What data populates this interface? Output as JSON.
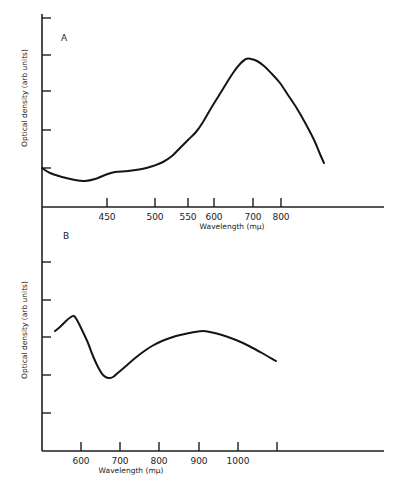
{
  "chart_data": [
    {
      "type": "line",
      "panel_label": "A",
      "title": "",
      "xlabel": "Wavelength (mμ)",
      "ylabel": "Optical density (arb units)",
      "x_scale": "nonlinear (wavenumber-like)",
      "x_ticks": [
        450,
        500,
        550,
        600,
        700,
        800
      ],
      "y_ticks_count": 5,
      "y_tick_labels": [],
      "grid": false,
      "series": [
        {
          "name": "Spectrum A",
          "points": [
            {
              "x": 390,
              "y": 1.0
            },
            {
              "x": 420,
              "y": 0.75
            },
            {
              "x": 450,
              "y": 0.85
            },
            {
              "x": 480,
              "y": 0.95
            },
            {
              "x": 500,
              "y": 1.05
            },
            {
              "x": 530,
              "y": 1.4
            },
            {
              "x": 550,
              "y": 1.7
            },
            {
              "x": 580,
              "y": 2.1
            },
            {
              "x": 600,
              "y": 2.5
            },
            {
              "x": 650,
              "y": 3.3
            },
            {
              "x": 700,
              "y": 3.8
            },
            {
              "x": 750,
              "y": 3.6
            },
            {
              "x": 800,
              "y": 3.1
            },
            {
              "x": 900,
              "y": 2.2
            },
            {
              "x": 1000,
              "y": 1.0
            }
          ]
        }
      ]
    },
    {
      "type": "line",
      "panel_label": "B",
      "title": "",
      "xlabel": "Wavelength (mμ)",
      "ylabel": "Optical density (arb units)",
      "x_scale": "linear",
      "x_ticks": [
        600,
        700,
        800,
        900,
        1000,
        1100
      ],
      "x_tick_labels": [
        "600",
        "700",
        "800",
        "900",
        "1000",
        ""
      ],
      "y_ticks_count": 5,
      "y_tick_labels": [],
      "grid": false,
      "series": [
        {
          "name": "Spectrum B",
          "points": [
            {
              "x": 535,
              "y": 3.15
            },
            {
              "x": 585,
              "y": 3.6
            },
            {
              "x": 615,
              "y": 3.05
            },
            {
              "x": 650,
              "y": 2.1
            },
            {
              "x": 675,
              "y": 1.95
            },
            {
              "x": 700,
              "y": 2.1
            },
            {
              "x": 750,
              "y": 2.45
            },
            {
              "x": 800,
              "y": 2.8
            },
            {
              "x": 850,
              "y": 3.0
            },
            {
              "x": 900,
              "y": 3.1
            },
            {
              "x": 950,
              "y": 3.05
            },
            {
              "x": 1000,
              "y": 2.85
            },
            {
              "x": 1050,
              "y": 2.6
            },
            {
              "x": 1100,
              "y": 2.35
            }
          ]
        }
      ]
    }
  ],
  "panels": {
    "a": {
      "label": "A",
      "xlabel": "Wavelength (mμ)",
      "ylabel": "Optical density (arb units)",
      "ticks": [
        {
          "label": "450",
          "px": 107
        },
        {
          "label": "500",
          "px": 155
        },
        {
          "label": "550",
          "px": 188
        },
        {
          "label": "600",
          "px": 214
        },
        {
          "label": "700",
          "px": 253
        },
        {
          "label": "800",
          "px": 281
        }
      ],
      "ytick_px": [
        18,
        55,
        91,
        130,
        168
      ],
      "curve_px": [
        [
          42,
          168
        ],
        [
          50,
          173
        ],
        [
          62,
          177
        ],
        [
          75,
          180
        ],
        [
          85,
          181
        ],
        [
          95,
          179
        ],
        [
          105,
          175
        ],
        [
          115,
          172
        ],
        [
          128,
          171
        ],
        [
          142,
          169
        ],
        [
          153,
          166
        ],
        [
          163,
          162
        ],
        [
          172,
          156
        ],
        [
          180,
          148
        ],
        [
          188,
          140
        ],
        [
          196,
          132
        ],
        [
          203,
          122
        ],
        [
          210,
          110
        ],
        [
          218,
          97
        ],
        [
          226,
          84
        ],
        [
          233,
          73
        ],
        [
          240,
          64
        ],
        [
          246,
          59
        ],
        [
          251,
          59
        ],
        [
          257,
          61
        ],
        [
          264,
          66
        ],
        [
          272,
          74
        ],
        [
          280,
          83
        ],
        [
          288,
          95
        ],
        [
          296,
          107
        ],
        [
          303,
          119
        ],
        [
          309,
          130
        ],
        [
          315,
          142
        ],
        [
          320,
          154
        ],
        [
          324,
          163
        ]
      ]
    },
    "b": {
      "label": "B",
      "xlabel": "Wavelength (mμ)",
      "ylabel": "Optical density (arb units)",
      "ticks": [
        {
          "label": "600",
          "px": 81
        },
        {
          "label": "700",
          "px": 120
        },
        {
          "label": "800",
          "px": 159
        },
        {
          "label": "900",
          "px": 199
        },
        {
          "label": "1000",
          "px": 238
        },
        {
          "label": "",
          "px": 277
        }
      ],
      "ytick_px": [
        262,
        300,
        337,
        375,
        413
      ],
      "curve_px": [
        [
          55,
          331
        ],
        [
          60,
          327
        ],
        [
          66,
          321
        ],
        [
          71,
          317
        ],
        [
          74,
          316
        ],
        [
          77,
          320
        ],
        [
          82,
          330
        ],
        [
          88,
          343
        ],
        [
          93,
          356
        ],
        [
          98,
          367
        ],
        [
          103,
          375
        ],
        [
          108,
          378
        ],
        [
          113,
          377
        ],
        [
          119,
          372
        ],
        [
          126,
          366
        ],
        [
          134,
          359
        ],
        [
          143,
          352
        ],
        [
          152,
          346
        ],
        [
          162,
          341
        ],
        [
          173,
          337
        ],
        [
          185,
          334
        ],
        [
          195,
          332
        ],
        [
          203,
          331
        ],
        [
          210,
          332
        ],
        [
          222,
          335
        ],
        [
          236,
          340
        ],
        [
          249,
          346
        ],
        [
          262,
          353
        ],
        [
          276,
          361
        ]
      ]
    }
  }
}
